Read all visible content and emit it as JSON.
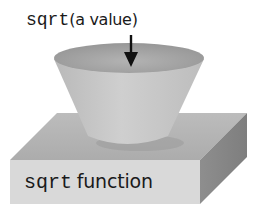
{
  "diagram": {
    "input_label": {
      "function_part": "sqrt",
      "argument_part": "(a value)"
    },
    "box_label": {
      "function_part": "sqrt",
      "description_part": "function"
    },
    "shapes": {
      "funnel": "cone-funnel",
      "machine": "3d-box",
      "arrow": "down-arrow"
    },
    "colors": {
      "box_top": "#b4b4b4",
      "box_front": "#d9d9d9",
      "box_side": "#8c8c8c",
      "cone_inner": "#a6a6a6",
      "cone_outer": "#c8c8c8",
      "text": "#1a1a1a"
    }
  }
}
